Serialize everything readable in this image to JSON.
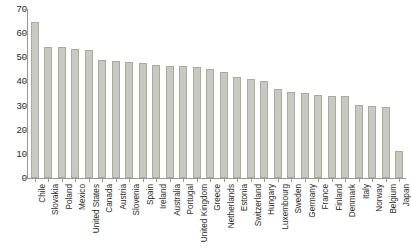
{
  "chart_data": {
    "type": "bar",
    "title": "",
    "subtitle": "",
    "xlabel": "",
    "ylabel": "",
    "ylim": [
      0,
      70
    ],
    "yticks": [
      0,
      10,
      20,
      30,
      40,
      50,
      60,
      70
    ],
    "grid": false,
    "legend": null,
    "orientation": "vertical",
    "bar_color": "#c8cac0",
    "bar_border_color": "#a9aba1",
    "axis_color": "#9a9a92",
    "text_color": "#2b2b2b",
    "categories": [
      "Chile",
      "Slovakia",
      "Poland",
      "Mexico",
      "United States",
      "Canada",
      "Austria",
      "Slovenia",
      "Spain",
      "Ireland",
      "Australia",
      "Portugal",
      "United Kingdom",
      "Greece",
      "Netherlands",
      "Estonia",
      "Switzerland",
      "Hungary",
      "Luxembourg",
      "Sweden",
      "Germany",
      "France",
      "Finland",
      "Denmark",
      "Italy",
      "Norway",
      "Belgium",
      "Japan"
    ],
    "values": [
      64.8,
      54.2,
      54.1,
      53.4,
      53.1,
      48.7,
      48.3,
      48.2,
      47.8,
      46.8,
      46.4,
      46.2,
      45.9,
      45.1,
      43.8,
      42.0,
      41.0,
      40.3,
      36.8,
      35.7,
      35.4,
      34.2,
      33.9,
      33.8,
      30.4,
      29.7,
      29.5,
      11.0
    ]
  }
}
